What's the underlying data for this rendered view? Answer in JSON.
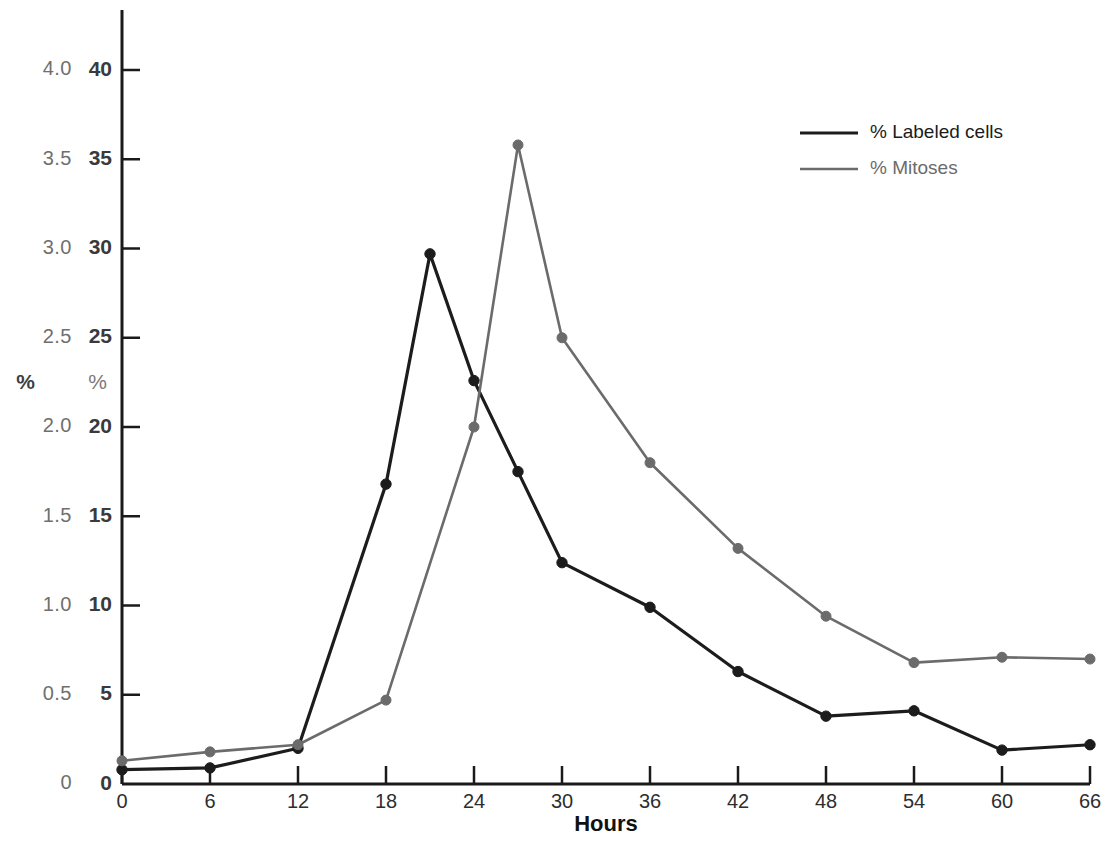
{
  "chart_data": {
    "type": "line",
    "title": "",
    "xlabel": "Hours",
    "x": [
      0,
      6,
      12,
      18,
      21,
      24,
      27,
      30,
      36,
      42,
      48,
      54,
      60,
      66
    ],
    "xlim": [
      0,
      66
    ],
    "xticks": [
      "0",
      "6",
      "12",
      "18",
      "24",
      "30",
      "36",
      "42",
      "48",
      "54",
      "60",
      "66"
    ],
    "grid": false,
    "legend_position": "top-right",
    "axes": [
      {
        "id": "left",
        "ylabel": "%",
        "ylim": [
          0,
          4.3
        ],
        "yticks": [
          "0",
          "0.5",
          "1.0",
          "1.5",
          "2.0",
          "2.5",
          "3.0",
          "3.5",
          "4.0"
        ],
        "ytick_values": [
          0,
          0.5,
          1.0,
          1.5,
          2.0,
          2.5,
          3.0,
          3.5,
          4.0
        ]
      },
      {
        "id": "right",
        "ylabel": "%",
        "ylim": [
          0,
          43
        ],
        "yticks": [
          "0",
          "5",
          "10",
          "15",
          "20",
          "25",
          "30",
          "35",
          "40"
        ],
        "ytick_values": [
          0,
          5,
          10,
          15,
          20,
          25,
          30,
          35,
          40
        ]
      }
    ],
    "series": [
      {
        "name": "% Labeled cells",
        "color": "#1c1c1c",
        "axis": "right",
        "points": [
          {
            "x": 0,
            "y": 0.8
          },
          {
            "x": 6,
            "y": 0.9
          },
          {
            "x": 12,
            "y": 2.0
          },
          {
            "x": 18,
            "y": 16.8
          },
          {
            "x": 21,
            "y": 29.7
          },
          {
            "x": 24,
            "y": 22.6
          },
          {
            "x": 27,
            "y": 17.5
          },
          {
            "x": 30,
            "y": 12.4
          },
          {
            "x": 36,
            "y": 9.9
          },
          {
            "x": 42,
            "y": 6.3
          },
          {
            "x": 48,
            "y": 3.8
          },
          {
            "x": 54,
            "y": 4.1
          },
          {
            "x": 60,
            "y": 1.9
          },
          {
            "x": 66,
            "y": 2.2
          }
        ]
      },
      {
        "name": "% Mitoses",
        "color": "#6b6b6b",
        "axis": "right",
        "points": [
          {
            "x": 0,
            "y": 1.3
          },
          {
            "x": 6,
            "y": 1.8
          },
          {
            "x": 12,
            "y": 2.2
          },
          {
            "x": 18,
            "y": 4.7
          },
          {
            "x": 24,
            "y": 20.0
          },
          {
            "x": 27,
            "y": 35.8
          },
          {
            "x": 30,
            "y": 25.0
          },
          {
            "x": 36,
            "y": 18.0
          },
          {
            "x": 42,
            "y": 13.2
          },
          {
            "x": 48,
            "y": 9.4
          },
          {
            "x": 54,
            "y": 6.8
          },
          {
            "x": 60,
            "y": 7.1
          },
          {
            "x": 66,
            "y": 7.0
          }
        ]
      }
    ]
  },
  "legend": {
    "entries": [
      {
        "label": "% Labeled cells",
        "color": "#1c1c1c"
      },
      {
        "label": "% Mitoses",
        "color": "#6b6b6b"
      }
    ]
  },
  "axis_left": {
    "unit": "%",
    "labels": [
      "4.0",
      "3.5",
      "3.0",
      "2.5",
      "2.0",
      "1.5",
      "1.0",
      "0.5",
      "0"
    ]
  },
  "axis_right": {
    "unit": "%",
    "labels": [
      "40",
      "35",
      "30",
      "25",
      "20",
      "15",
      "10",
      "5",
      "0"
    ]
  },
  "axis_bottom": {
    "title": "Hours",
    "labels": [
      "0",
      "6",
      "12",
      "18",
      "24",
      "30",
      "36",
      "42",
      "48",
      "54",
      "60",
      "66"
    ]
  },
  "colors": {
    "series_labeled_cells": "#1c1c1c",
    "series_mitoses": "#6b6b6b",
    "axis": "#1a1a1a",
    "tick_text_left": "#6f6f6f",
    "tick_text_right": "#3a3a3a",
    "background": "#ffffff"
  }
}
